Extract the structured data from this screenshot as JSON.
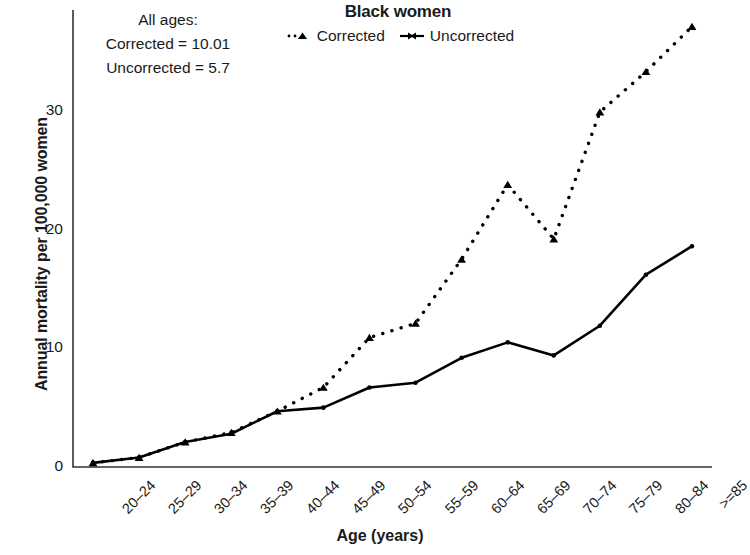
{
  "chart_data": {
    "type": "line",
    "title": "Black women",
    "xlabel": "Age (years)",
    "ylabel": "Annual mortality per 100,000 women",
    "categories": [
      "20–24",
      "25–29",
      "30–34",
      "35–39",
      "40–44",
      "45–49",
      "50–54",
      "55–59",
      "60–64",
      "65–69",
      "70–74",
      "75–79",
      "80–84",
      ">=85"
    ],
    "series": [
      {
        "name": "Corrected",
        "style": "dotted",
        "marker": "triangle",
        "color": "#000000",
        "values": [
          0.35,
          0.8,
          2.1,
          2.9,
          4.7,
          6.7,
          10.9,
          12.1,
          17.5,
          23.8,
          19.2,
          29.9,
          33.3,
          37.1
        ]
      },
      {
        "name": "Uncorrected",
        "style": "solid",
        "marker": "dot",
        "color": "#000000",
        "values": [
          0.35,
          0.8,
          2.1,
          2.8,
          4.7,
          5.0,
          6.7,
          7.1,
          9.2,
          10.5,
          9.4,
          11.9,
          16.2,
          18.6
        ]
      }
    ],
    "yticks": [
      0,
      10,
      20,
      30
    ],
    "ylim": [
      0,
      38.5
    ],
    "grid": false,
    "legend_position": "top-center",
    "annotations": {
      "line1": "All ages:",
      "line2": "Corrected = 10.01",
      "line3": "Uncorrected = 5.7"
    }
  }
}
